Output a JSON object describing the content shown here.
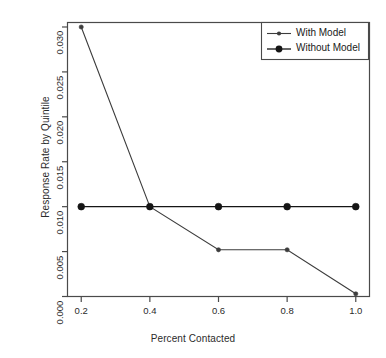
{
  "chart_data": {
    "type": "line",
    "title": "",
    "xlabel": "Percent Contacted",
    "ylabel": "Response Rate by Quintile",
    "x": [
      0.2,
      0.4,
      0.6,
      0.8,
      1.0
    ],
    "xlim": [
      0.16,
      1.04
    ],
    "ylim": [
      0.0,
      0.0305
    ],
    "xticks": [
      0.2,
      0.4,
      0.6,
      0.8,
      1.0
    ],
    "xtick_labels": [
      "0.2",
      "0.4",
      "0.6",
      "0.8",
      "1.0"
    ],
    "yticks": [
      0.0,
      0.005,
      0.01,
      0.015,
      0.02,
      0.025,
      0.03
    ],
    "ytick_labels": [
      "0.000",
      "0.005",
      "0.010",
      "0.015",
      "0.020",
      "0.025",
      "0.030"
    ],
    "grid": false,
    "legend_position": "top-right",
    "series": [
      {
        "name": "With Model",
        "values": [
          0.03,
          0.01,
          0.0052,
          0.0052,
          0.0003
        ],
        "color": "#3c3c3c",
        "marker": "small-dot",
        "marker_size": 2.1,
        "line_width": 1.1
      },
      {
        "name": "Without Model",
        "values": [
          0.01,
          0.01,
          0.01,
          0.01,
          0.01
        ],
        "color": "#151515",
        "marker": "filled-circle",
        "marker_size": 3.4,
        "line_width": 1.3
      }
    ]
  },
  "legend": {
    "entries": [
      {
        "label": "With Model"
      },
      {
        "label": "Without Model"
      }
    ]
  },
  "colors": {
    "axis": "#4a4a4a",
    "text": "#2b2b2b",
    "background": "#ffffff",
    "series_with_model": "#3c3c3c",
    "series_without_model": "#151515"
  }
}
